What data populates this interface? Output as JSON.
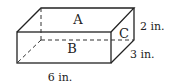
{
  "diagram": {
    "type": "rectangular-prism",
    "faces": {
      "top": "A",
      "front": "B",
      "side": "C"
    },
    "dimensions": {
      "length": "6 in.",
      "depth": "3 in.",
      "height": "2 in."
    },
    "stroke_color": "#222222"
  }
}
